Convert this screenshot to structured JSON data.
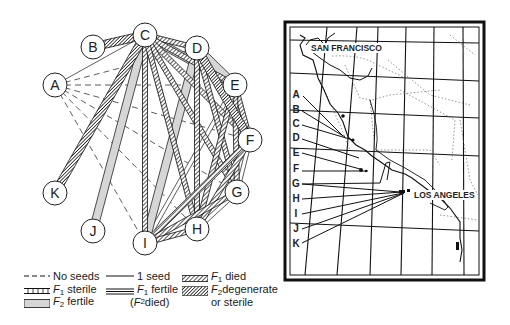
{
  "diagram": {
    "title": "",
    "nodes": [
      {
        "id": "A",
        "x": 55,
        "y": 85
      },
      {
        "id": "B",
        "x": 93,
        "y": 47
      },
      {
        "id": "C",
        "x": 145,
        "y": 35
      },
      {
        "id": "D",
        "x": 197,
        "y": 48
      },
      {
        "id": "E",
        "x": 235,
        "y": 85
      },
      {
        "id": "F",
        "x": 250,
        "y": 140
      },
      {
        "id": "G",
        "x": 237,
        "y": 192
      },
      {
        "id": "H",
        "x": 197,
        "y": 229
      },
      {
        "id": "I",
        "x": 145,
        "y": 243
      },
      {
        "id": "J",
        "x": 93,
        "y": 231
      },
      {
        "id": "K",
        "x": 55,
        "y": 193
      }
    ],
    "edges": [
      {
        "from": "B",
        "to": "C",
        "type": "f2_degenerate"
      },
      {
        "from": "A",
        "to": "C",
        "type": "one_seed"
      },
      {
        "from": "A",
        "to": "D",
        "type": "no_seeds"
      },
      {
        "from": "A",
        "to": "E",
        "type": "no_seeds"
      },
      {
        "from": "A",
        "to": "F",
        "type": "no_seeds"
      },
      {
        "from": "A",
        "to": "G",
        "type": "no_seeds"
      },
      {
        "from": "A",
        "to": "H",
        "type": "no_seeds"
      },
      {
        "from": "A",
        "to": "I",
        "type": "no_seeds"
      },
      {
        "from": "C",
        "to": "K",
        "type": "f2_degenerate"
      },
      {
        "from": "C",
        "to": "J",
        "type": "f2_fertile"
      },
      {
        "from": "C",
        "to": "I",
        "type": "f1_died"
      },
      {
        "from": "C",
        "to": "D",
        "type": "f1_died"
      },
      {
        "from": "C",
        "to": "E",
        "type": "f1_died"
      },
      {
        "from": "C",
        "to": "F",
        "type": "f1_died"
      },
      {
        "from": "C",
        "to": "G",
        "type": "f1_died"
      },
      {
        "from": "C",
        "to": "H",
        "type": "f1_died"
      },
      {
        "from": "C",
        "to": "E",
        "type": "f2_fertile"
      },
      {
        "from": "D",
        "to": "E",
        "type": "f2_fertile"
      },
      {
        "from": "D",
        "to": "I",
        "type": "f2_fertile"
      },
      {
        "from": "D",
        "to": "H",
        "type": "f1_died"
      },
      {
        "from": "D",
        "to": "G",
        "type": "f1_died"
      },
      {
        "from": "D",
        "to": "F",
        "type": "f2_degenerate"
      },
      {
        "from": "E",
        "to": "F",
        "type": "f1_died"
      },
      {
        "from": "E",
        "to": "G",
        "type": "f1_died"
      },
      {
        "from": "E",
        "to": "H",
        "type": "f1_died"
      },
      {
        "from": "E",
        "to": "I",
        "type": "f1_sterile"
      },
      {
        "from": "F",
        "to": "G",
        "type": "f1_sterile"
      },
      {
        "from": "F",
        "to": "H",
        "type": "f1_died"
      },
      {
        "from": "F",
        "to": "I",
        "type": "f1_died"
      },
      {
        "from": "G",
        "to": "H",
        "type": "f1_sterile"
      },
      {
        "from": "G",
        "to": "I",
        "type": "f1_died"
      },
      {
        "from": "H",
        "to": "I",
        "type": "f1_died"
      }
    ]
  },
  "legend": {
    "no_seeds": "No seeds",
    "f1_sterile_F": "F",
    "f1_sterile_sub": "1",
    "f1_sterile_text": " sterile",
    "f2_fertile_F": "F",
    "f2_fertile_sub": "2",
    "f2_fertile_text": " fertile",
    "one_seed": "1  seed",
    "f1_fertile_F": "F",
    "f1_fertile_sub": "1",
    "f1_fertile_text": " fertile",
    "f2_died_paren_open": "(",
    "f2_died_F": "F",
    "f2_died_sub": "2",
    "f2_died_text": " died)",
    "f1_died_F": "F",
    "f1_died_sub": "1",
    "f1_died_text": " died",
    "f2_degenerate_F": "F",
    "f2_degenerate_sub": "2",
    "f2_degenerate_text": "degenerate",
    "or_sterile": "or  sterile"
  },
  "map": {
    "city_labels": [
      "SAN FRANCISCO",
      "LOS ANGELES"
    ],
    "site_labels": [
      "A",
      "B",
      "C",
      "D",
      "E",
      "F",
      "G",
      "H",
      "I",
      "J",
      "K"
    ]
  },
  "colors": {
    "ink": "#1a1a1a",
    "f2_fertile_fill": "#d6d6d6",
    "background": "#ffffff"
  }
}
